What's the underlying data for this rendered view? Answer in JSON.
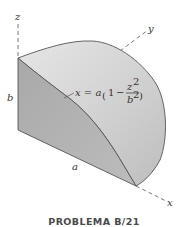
{
  "figure": {
    "caption": "PROBLEMA B/21",
    "axes": {
      "z": "z",
      "y": "y",
      "x": "x"
    },
    "dimensions": {
      "height_label": "b",
      "length_label": "a"
    },
    "equation": {
      "lhs": "x = a",
      "one": "1",
      "minus": "−",
      "num": "z",
      "num_exp": "2",
      "den": "b",
      "den_exp": "2",
      "open_paren": "(",
      "close_paren": ")"
    },
    "colors": {
      "front_face": "#b3b3b3",
      "curved_surface": "#d4d4d4",
      "edge": "#555555",
      "axis": "#555555"
    }
  }
}
